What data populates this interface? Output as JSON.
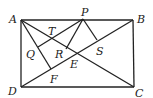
{
  "diagram": {
    "type": "geometry",
    "points": {
      "A": {
        "label": "A",
        "x": 21,
        "y": 20,
        "lx": 9,
        "ly": 23
      },
      "B": {
        "label": "B",
        "x": 133,
        "y": 20,
        "lx": 137,
        "ly": 23
      },
      "C": {
        "label": "C",
        "x": 134,
        "y": 87,
        "lx": 135,
        "ly": 97
      },
      "D": {
        "label": "D",
        "x": 21,
        "y": 87,
        "lx": 8,
        "ly": 95
      },
      "P": {
        "label": "P",
        "x": 83,
        "y": 19,
        "lx": 81,
        "ly": 16
      },
      "T": {
        "label": "T",
        "x": 52,
        "y": 38,
        "lx": 48,
        "ly": 35
      },
      "Q": {
        "label": "Q",
        "x": 38,
        "y": 47,
        "lx": 26,
        "ly": 58
      },
      "R": {
        "label": "R",
        "x": 66,
        "y": 49,
        "lx": 54,
        "ly": 58
      },
      "S": {
        "label": "S",
        "x": 97,
        "y": 40,
        "lx": 97,
        "ly": 55
      },
      "E": {
        "label": "E",
        "x": 78,
        "y": 53,
        "lx": 70,
        "ly": 68
      },
      "F": {
        "label": "F",
        "x": 51,
        "y": 69,
        "lx": 50,
        "ly": 82
      }
    },
    "segments": [
      [
        "A",
        "B"
      ],
      [
        "B",
        "C"
      ],
      [
        "C",
        "D"
      ],
      [
        "D",
        "A"
      ],
      [
        "A",
        "C"
      ],
      [
        "B",
        "D"
      ],
      [
        "A",
        "F"
      ],
      [
        "P",
        "Q"
      ],
      [
        "P",
        "R"
      ],
      [
        "P",
        "S"
      ]
    ]
  }
}
